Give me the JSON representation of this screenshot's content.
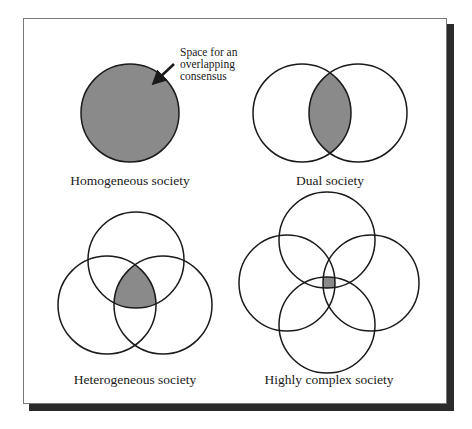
{
  "figure": {
    "annotation": [
      "Space for an",
      "overlapping",
      "consensus"
    ],
    "panels": [
      {
        "id": "homogeneous",
        "label": "Homogeneous society"
      },
      {
        "id": "dual",
        "label": "Dual society"
      },
      {
        "id": "heterogeneous",
        "label": "Heterogeneous society"
      },
      {
        "id": "highly-complex",
        "label": "Highly complex society"
      }
    ],
    "colors": {
      "overlap_fill": "#8a8a8a",
      "stroke": "#1a1a1a",
      "frame_shadow": "#2b2b2b"
    }
  }
}
